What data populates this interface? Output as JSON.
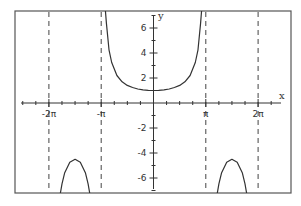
{
  "chart_data": {
    "type": "line",
    "title": "",
    "xlabel": "x",
    "ylabel": "y",
    "xlim_pi_units": [
      -2.5,
      2.6
    ],
    "ylim": [
      -7.2,
      7.4
    ],
    "grid": false,
    "legend": null,
    "x_tick_labels": [
      "-2π",
      "-π",
      "π",
      "2π"
    ],
    "x_tick_values_pi_units": [
      -2,
      -1,
      1,
      2
    ],
    "x_minor_tick_step_pi_units": 0.25,
    "y_tick_labels": [
      "6",
      "4",
      "2",
      "-2",
      "-4",
      "-6"
    ],
    "y_tick_values": [
      6,
      4,
      2,
      -2,
      -4,
      -6
    ],
    "y_minor_tick_step": 1,
    "asymptotes_pi_units": [
      -2,
      -1,
      1,
      2
    ],
    "series": [
      {
        "name": "upper branch",
        "x_pi_units": [
          -0.92,
          -0.9,
          -0.85,
          -0.8,
          -0.7,
          -0.6,
          -0.5,
          -0.4,
          -0.3,
          -0.2,
          -0.1,
          0,
          0.1,
          0.2,
          0.3,
          0.4,
          0.5,
          0.6,
          0.7,
          0.8,
          0.85,
          0.9,
          0.92
        ],
        "y": [
          7.4,
          6.39,
          4.26,
          3.24,
          2.2,
          1.7,
          1.41,
          1.24,
          1.12,
          1.05,
          1.01,
          1.0,
          1.01,
          1.05,
          1.12,
          1.24,
          1.41,
          1.7,
          2.2,
          3.24,
          4.26,
          6.39,
          7.4
        ]
      },
      {
        "name": "left lower lobe",
        "x_pi_units": [
          -1.78,
          -1.75,
          -1.7,
          -1.6,
          -1.5,
          -1.4,
          -1.3,
          -1.25,
          -1.22
        ],
        "y": [
          -7.21,
          -6.47,
          -5.61,
          -4.74,
          -4.5,
          -4.74,
          -5.61,
          -6.47,
          -7.21
        ]
      },
      {
        "name": "right lower lobe",
        "x_pi_units": [
          1.22,
          1.25,
          1.3,
          1.4,
          1.5,
          1.6,
          1.7,
          1.75,
          1.78
        ],
        "y": [
          -7.21,
          -6.47,
          -5.61,
          -4.74,
          -4.5,
          -4.74,
          -5.61,
          -6.47,
          -7.21
        ]
      }
    ]
  },
  "axes": {
    "x_label": "x",
    "y_label": "y"
  },
  "colors": {
    "frame": "#555555",
    "curve": "#333333",
    "asymptote": "#444444",
    "background": "#ffffff"
  }
}
